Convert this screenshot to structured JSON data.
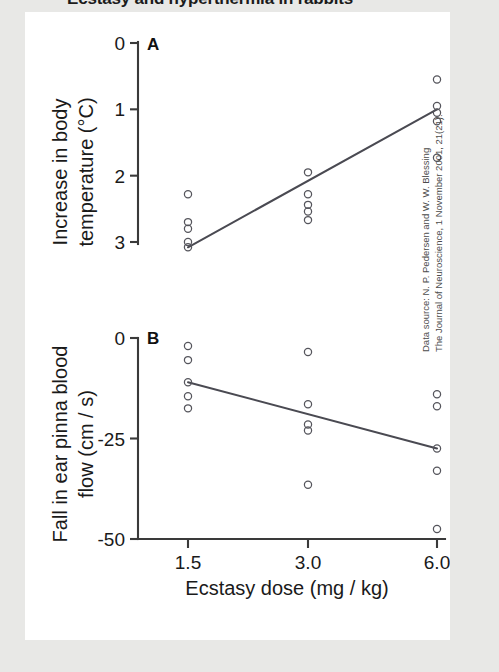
{
  "figure": {
    "title": "Ecstasy and hyperthermia in rabbits",
    "background_color": "#e8e8e6",
    "panel_color": "#ffffff",
    "marker_color": "#55555c",
    "line_color": "#4a4a52",
    "axis_color": "#3a3a3a"
  },
  "source": {
    "line1": "Data source: N. P. Pedersen and W. W. Blessing",
    "line2": "The Journal of Neuroscience, 1 November 2001, 21(21)."
  },
  "xaxis": {
    "label": "Ecstasy dose (mg / kg)",
    "ticks": [
      "1.5",
      "3.0",
      "6.0"
    ],
    "tick_values": [
      1.5,
      3.0,
      6.0
    ]
  },
  "panelA": {
    "letter": "A",
    "ylabel_line1": "Increase in body",
    "ylabel_line2": "temperature (°C)",
    "yticks": [
      "3",
      "2",
      "1",
      "0"
    ],
    "ytick_values": [
      3,
      2,
      1,
      0
    ]
  },
  "panelB": {
    "letter": "B",
    "ylabel_line1": "Fall in ear pinna blood",
    "ylabel_line2": "flow (cm / s)",
    "yticks": [
      "0",
      "-25",
      "-50"
    ],
    "ytick_values": [
      0,
      -25,
      -50
    ]
  },
  "chart_data": [
    {
      "type": "scatter",
      "panel": "A",
      "title": "Ecstasy and hyperthermia in rabbits",
      "subtitle": "Panel A",
      "xlabel": "Ecstasy dose (mg / kg)",
      "ylabel": "Increase in body temperature (°C)",
      "xscale": "categorical",
      "categories": [
        "1.5",
        "3.0",
        "6.0"
      ],
      "xlim": [
        0,
        3
      ],
      "ylim": [
        0,
        3
      ],
      "yticks": [
        0,
        1,
        2,
        3
      ],
      "grid": false,
      "legend": "none",
      "marker": "open-circle",
      "series": [
        {
          "name": "Individual rabbits",
          "points": [
            {
              "x": 1.5,
              "y": 0.72
            },
            {
              "x": 1.5,
              "y": 0.3
            },
            {
              "x": 1.5,
              "y": 0.2
            },
            {
              "x": 1.5,
              "y": 0.0
            },
            {
              "x": 1.5,
              "y": -0.08
            },
            {
              "x": 3.0,
              "y": 1.05
            },
            {
              "x": 3.0,
              "y": 0.72
            },
            {
              "x": 3.0,
              "y": 0.56
            },
            {
              "x": 3.0,
              "y": 0.46
            },
            {
              "x": 3.0,
              "y": 0.33
            },
            {
              "x": 6.0,
              "y": 2.45
            },
            {
              "x": 6.0,
              "y": 2.05
            },
            {
              "x": 6.0,
              "y": 1.95
            },
            {
              "x": 6.0,
              "y": 1.82
            },
            {
              "x": 6.0,
              "y": 1.27
            }
          ]
        }
      ],
      "fit_line": {
        "name": "Regression line",
        "x_start": 1.5,
        "y_start": -0.08,
        "x_end": 6.0,
        "y_end": 2.0
      }
    },
    {
      "type": "scatter",
      "panel": "B",
      "title": "Ecstasy and hyperthermia in rabbits",
      "subtitle": "Panel B",
      "xlabel": "Ecstasy dose (mg / kg)",
      "ylabel": "Fall in ear pinna blood flow (cm / s)",
      "xscale": "categorical",
      "categories": [
        "1.5",
        "3.0",
        "6.0"
      ],
      "xlim": [
        0,
        3
      ],
      "ylim": [
        -50,
        2
      ],
      "yticks": [
        0,
        -25,
        -50
      ],
      "grid": false,
      "legend": "none",
      "marker": "open-circle",
      "series": [
        {
          "name": "Individual rabbits",
          "points": [
            {
              "x": 1.5,
              "y": -2.0
            },
            {
              "x": 1.5,
              "y": -5.5
            },
            {
              "x": 1.5,
              "y": -11.0
            },
            {
              "x": 1.5,
              "y": -14.5
            },
            {
              "x": 1.5,
              "y": -17.5
            },
            {
              "x": 3.0,
              "y": -3.5
            },
            {
              "x": 3.0,
              "y": -16.5
            },
            {
              "x": 3.0,
              "y": -21.5
            },
            {
              "x": 3.0,
              "y": -23.0
            },
            {
              "x": 3.0,
              "y": -36.5
            },
            {
              "x": 6.0,
              "y": -14.0
            },
            {
              "x": 6.0,
              "y": -17.0
            },
            {
              "x": 6.0,
              "y": -27.5
            },
            {
              "x": 6.0,
              "y": -33.0
            },
            {
              "x": 6.0,
              "y": -47.5
            }
          ]
        }
      ],
      "fit_line": {
        "name": "Regression line",
        "x_start": 1.5,
        "y_start": -11.0,
        "x_end": 6.0,
        "y_end": -27.5
      }
    }
  ]
}
